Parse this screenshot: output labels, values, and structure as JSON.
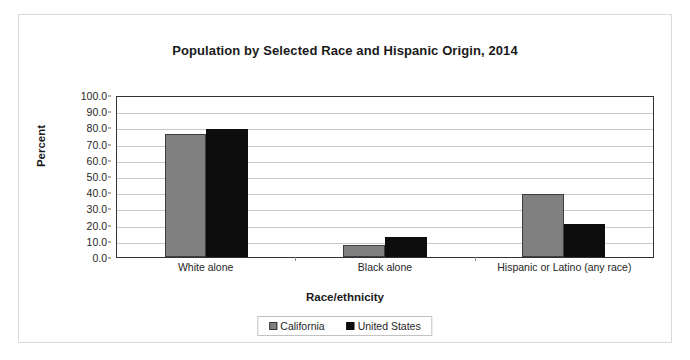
{
  "chart_data": {
    "type": "bar",
    "title": "Population by Selected Race and Hispanic Origin, 2014",
    "xlabel": "Race/ethnicity",
    "ylabel": "Percent",
    "ylim": [
      0,
      100
    ],
    "ytick_step": 10,
    "ytick_labels": [
      "0.0",
      "10.0",
      "20.0",
      "30.0",
      "40.0",
      "50.0",
      "60.0",
      "70.0",
      "80.0",
      "90.0",
      "100.0"
    ],
    "grid": true,
    "legend_position": "bottom",
    "categories": [
      "White alone",
      "Black alone",
      "Hispanic or Latino (any race)"
    ],
    "series": [
      {
        "name": "California",
        "color": "#808080",
        "values": [
          76.2,
          7.7,
          38.9
        ]
      },
      {
        "name": "United States",
        "color": "#0d0d0d",
        "values": [
          79.3,
          12.6,
          20.4
        ]
      }
    ]
  }
}
